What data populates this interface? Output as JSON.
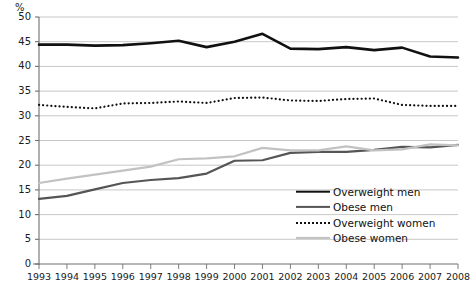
{
  "chart_data": {
    "type": "line",
    "title": "",
    "subtitle": "",
    "xlabel": "",
    "ylabel": "%",
    "ylim": [
      0,
      50
    ],
    "ytick_step": 5,
    "yticks": [
      0,
      5,
      10,
      15,
      20,
      25,
      30,
      35,
      40,
      45,
      50
    ],
    "grid": true,
    "grid_axis": "y",
    "legend_position": "inside-right",
    "x": [
      1993,
      1994,
      1995,
      1996,
      1997,
      1998,
      1999,
      2000,
      2001,
      2002,
      2003,
      2004,
      2005,
      2006,
      2007,
      2008
    ],
    "categories": [
      "1993",
      "1994",
      "1995",
      "1996",
      "1997",
      "1998",
      "1999",
      "2000",
      "2001",
      "2002",
      "2003",
      "2004",
      "2005",
      "2006",
      "2007",
      "2008"
    ],
    "series": [
      {
        "name": "Overweight men",
        "key": "overweight_men",
        "style": "solid-thick",
        "color": "#111111",
        "width": 2.6,
        "values": [
          44.4,
          44.4,
          44.2,
          44.3,
          44.7,
          45.2,
          43.9,
          45.0,
          46.6,
          43.6,
          43.5,
          43.9,
          43.3,
          43.8,
          42.0,
          41.8
        ]
      },
      {
        "name": "Obese men",
        "key": "obese_men",
        "style": "solid-medium",
        "color": "#555555",
        "width": 2.2,
        "values": [
          13.2,
          13.8,
          15.1,
          16.4,
          17.0,
          17.4,
          18.3,
          20.9,
          21.0,
          22.5,
          22.7,
          22.7,
          23.1,
          23.7,
          23.6,
          24.1
        ]
      },
      {
        "name": "Overweight women",
        "key": "overweight_women",
        "style": "dotted",
        "color": "#111111",
        "width": 2.2,
        "values": [
          32.2,
          31.8,
          31.5,
          32.5,
          32.6,
          32.9,
          32.6,
          33.6,
          33.7,
          33.1,
          33.0,
          33.4,
          33.5,
          32.2,
          32.0,
          32.0
        ]
      },
      {
        "name": "Obese women",
        "key": "obese_women",
        "style": "solid-light",
        "color": "#c2c2c2",
        "width": 2.2,
        "values": [
          16.4,
          17.3,
          18.1,
          18.9,
          19.7,
          21.2,
          21.4,
          21.8,
          23.5,
          23.0,
          23.0,
          23.8,
          23.0,
          23.2,
          24.2,
          24.0
        ]
      }
    ]
  },
  "axis": {
    "y_unit": "%",
    "y_labels": [
      "50",
      "45",
      "40",
      "35",
      "30",
      "25",
      "20",
      "15",
      "10",
      "5",
      "0"
    ],
    "x_labels": [
      "1993",
      "1994",
      "1995",
      "1996",
      "1997",
      "1998",
      "1999",
      "2000",
      "2001",
      "2002",
      "2003",
      "2004",
      "2005",
      "2006",
      "2007",
      "2008"
    ]
  },
  "legend": {
    "items": [
      {
        "label": "Overweight men",
        "swatch": "solid-thick"
      },
      {
        "label": "Obese men",
        "swatch": "solid-medium"
      },
      {
        "label": "Overweight women",
        "swatch": "dotted"
      },
      {
        "label": "Obese women",
        "swatch": "solid-light"
      }
    ]
  },
  "colors": {
    "overweight_men": "#111111",
    "obese_men": "#555555",
    "overweight_women": "#111111",
    "obese_women": "#c2c2c2",
    "grid": "#b9b9b9",
    "axis": "#6f6f6f",
    "text": "#1a1a1a"
  }
}
